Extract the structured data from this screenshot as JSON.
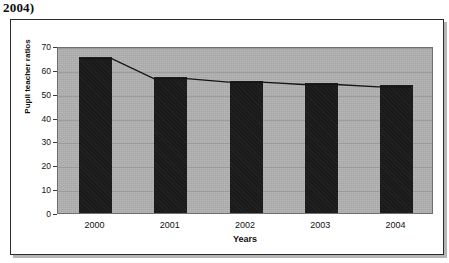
{
  "caption": {
    "fragment": "2004)"
  },
  "chart_data": {
    "type": "bar",
    "title": "",
    "xlabel": "Years",
    "ylabel": "Pupil teacher ratios",
    "categories": [
      "2000",
      "2001",
      "2002",
      "2003",
      "2004"
    ],
    "values": [
      65.5,
      57.0,
      55.5,
      54.5,
      53.5
    ],
    "series": [
      {
        "name": "Pupil teacher ratios (bars)",
        "type": "bar",
        "values": [
          65.5,
          57.0,
          55.5,
          54.5,
          53.5
        ]
      },
      {
        "name": "Pupil teacher ratios (trend line)",
        "type": "line",
        "values": [
          65.5,
          57.0,
          55.5,
          54.5,
          53.5
        ]
      }
    ],
    "ylim": [
      0,
      70
    ],
    "ytick_labels": [
      "0",
      "10",
      "20",
      "30",
      "40",
      "50",
      "60",
      "70"
    ],
    "ytick_values": [
      0,
      10,
      20,
      30,
      40,
      50,
      60,
      70
    ],
    "grid": true,
    "legend": "none",
    "colors": {
      "bar": "#1a1a1a",
      "line": "#151515",
      "plot_background": "#b0b0b0",
      "figure_background": "#ffffff",
      "frame_border": "#2b2b2b",
      "text": "#111111"
    }
  }
}
